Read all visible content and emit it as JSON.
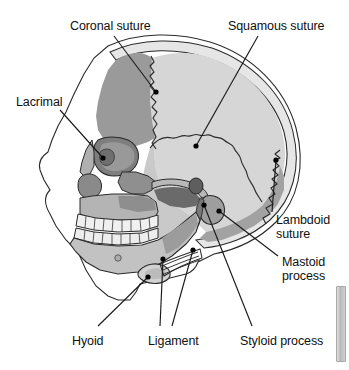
{
  "figure": {
    "type": "anatomical-diagram",
    "width": 349,
    "height": 370,
    "background_color": "#ffffff"
  },
  "palette": {
    "outline": "#1a1a1a",
    "background": "#ffffff",
    "frontal_bone": "#9a9a9a",
    "parietal_bone": "#d6d6d6",
    "temporal_bone": "#c9c9c9",
    "occipital_bone": "#a2a2a2",
    "zygomatic_bone": "#8f8f8f",
    "maxilla": "#b4b4b4",
    "mandible": "#c2c2c2",
    "teeth": "#f0f0f0",
    "shadow_dark": "#6a6a6a",
    "shadow_mid": "#848484",
    "soft_tissue": "#ffffff",
    "label_text": "#101010",
    "leader_line": "#1a1a1a",
    "leader_dot": "#000000"
  },
  "labels": [
    {
      "id": "coronal-suture",
      "text": "Coronal suture",
      "lines": [
        "Coronal suture"
      ],
      "x": 70,
      "y": 20,
      "align": "left",
      "target": [
        156,
        92
      ]
    },
    {
      "id": "squamous-suture",
      "text": "Squamous suture",
      "lines": [
        "Squamous suture"
      ],
      "x": 228,
      "y": 20,
      "align": "left",
      "target": [
        196,
        146
      ]
    },
    {
      "id": "lacrimal",
      "text": "Lacrimal",
      "lines": [
        "Lacrimal"
      ],
      "x": 16,
      "y": 96,
      "align": "left",
      "target": [
        103,
        158
      ]
    },
    {
      "id": "lambdoid-suture",
      "text": "Lambdoid suture",
      "lines": [
        "Lambdoid",
        "suture"
      ],
      "x": 276,
      "y": 214,
      "align": "left",
      "target": [
        276,
        160
      ]
    },
    {
      "id": "mastoid-process",
      "text": "Mastoid process",
      "lines": [
        "Mastoid",
        "process"
      ],
      "x": 282,
      "y": 256,
      "align": "left",
      "target": [
        219,
        211
      ]
    },
    {
      "id": "hyoid",
      "text": "Hyoid",
      "lines": [
        "Hyoid"
      ],
      "x": 72,
      "y": 335,
      "align": "left",
      "target": [
        148,
        277
      ]
    },
    {
      "id": "ligament",
      "text": "Ligament",
      "lines": [
        "Ligament"
      ],
      "x": 148,
      "y": 335,
      "align": "left",
      "targets": [
        [
          163,
          259
        ],
        [
          193,
          250
        ]
      ]
    },
    {
      "id": "styloid-process",
      "text": "Styloid process",
      "lines": [
        "Styloid process"
      ],
      "x": 240,
      "y": 335,
      "align": "left",
      "target": [
        204,
        205
      ]
    }
  ],
  "structures": [
    {
      "id": "frontal-bone",
      "name": "Frontal bone"
    },
    {
      "id": "parietal-bone",
      "name": "Parietal bone"
    },
    {
      "id": "temporal-bone",
      "name": "Temporal bone"
    },
    {
      "id": "occipital-bone",
      "name": "Occipital bone"
    },
    {
      "id": "zygomatic-bone",
      "name": "Zygomatic bone"
    },
    {
      "id": "maxilla",
      "name": "Maxilla"
    },
    {
      "id": "mandible",
      "name": "Mandible"
    },
    {
      "id": "nasal-bone",
      "name": "Nasal bone"
    },
    {
      "id": "orbit",
      "name": "Orbit (eye socket)"
    },
    {
      "id": "upper-teeth",
      "name": "Upper teeth"
    },
    {
      "id": "lower-teeth",
      "name": "Lower teeth"
    },
    {
      "id": "hyoid-bone",
      "name": "Hyoid bone"
    },
    {
      "id": "stylohyoid-ligament",
      "name": "Stylohyoid ligament"
    },
    {
      "id": "mastoid-process-structure",
      "name": "Mastoid process"
    },
    {
      "id": "styloid-process-structure",
      "name": "Styloid process"
    },
    {
      "id": "external-acoustic-meatus",
      "name": "External acoustic meatus"
    },
    {
      "id": "soft-tissue-profile",
      "name": "Soft tissue facial profile"
    }
  ]
}
